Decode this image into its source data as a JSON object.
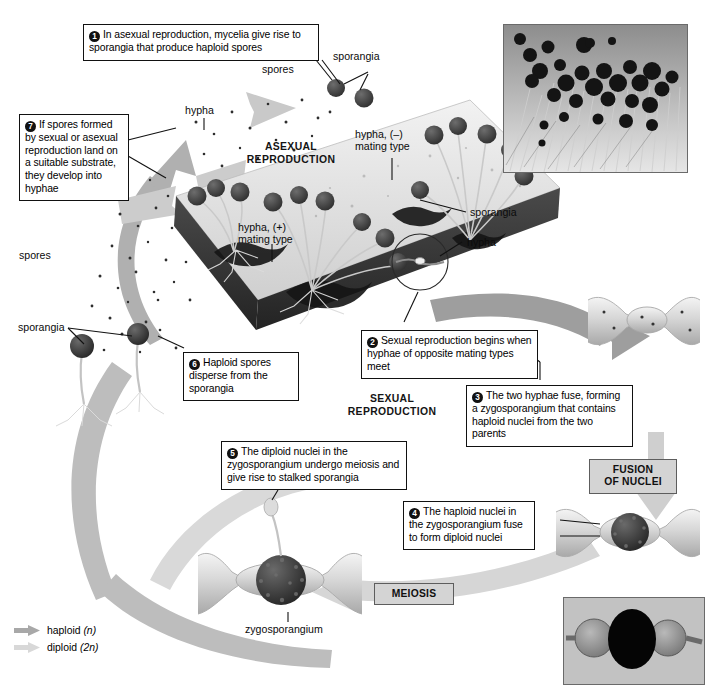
{
  "figure": {
    "colors": {
      "haploid_arrow": "#a8a8a8",
      "diploid_arrow": "#d8d8d8",
      "callout_border": "#111111",
      "stage_box_fill": "#d4d4d4",
      "stage_box_border": "#5d5d5d",
      "substrate_dark": "#3a3a3a",
      "sporangium": "#4a4a4a",
      "background": "#ffffff"
    }
  },
  "callouts": [
    {
      "id": 1,
      "number": "1",
      "text": "In asexual reproduction, mycelia give rise to sporangia that produce haploid spores"
    },
    {
      "id": 2,
      "number": "2",
      "text": "Sexual reproduction begins when hyphae of opposite mating types meet"
    },
    {
      "id": 3,
      "number": "3",
      "text": "The two hyphae fuse, forming a zygosporangium that contains haploid nuclei from the two parents"
    },
    {
      "id": 4,
      "number": "4",
      "text": "The haploid nuclei in the zygosporangium fuse to form diploid nuclei"
    },
    {
      "id": 5,
      "number": "5",
      "text": "The diploid nuclei in the zygosporangium undergo meiosis and give rise to stalked sporangia"
    },
    {
      "id": 6,
      "number": "6",
      "text": "Haploid spores disperse from the sporangia"
    },
    {
      "id": 7,
      "number": "7",
      "text": "If spores formed by sexual or asexual reproduction land on a suitable substrate, they develop into hyphae"
    }
  ],
  "stage_boxes": [
    {
      "id": "fusion",
      "text": "FUSION\nOF NUCLEI"
    },
    {
      "id": "meiosis",
      "text": "MEIOSIS"
    }
  ],
  "stage_words": [
    {
      "id": "asexual",
      "text": "ASEXUAL\nREPRODUCTION"
    },
    {
      "id": "sexual",
      "text": "SEXUAL\nREPRODUCTION"
    }
  ],
  "labels": [
    {
      "id": "spores-top",
      "text": "spores"
    },
    {
      "id": "sporangia-top",
      "text": "sporangia"
    },
    {
      "id": "hypha-top",
      "text": "hypha"
    },
    {
      "id": "hypha-minus",
      "text": "hypha, (–)\nmating type"
    },
    {
      "id": "hypha-plus",
      "text": "hypha, (+)\nmating type"
    },
    {
      "id": "sporangia-right",
      "text": "sporangia"
    },
    {
      "id": "hypha-right",
      "text": "hypha"
    },
    {
      "id": "spores-left",
      "text": "spores"
    },
    {
      "id": "sporangia-left",
      "text": "sporangia"
    },
    {
      "id": "zygosporangium",
      "text": "zygosporangium"
    }
  ],
  "legend": {
    "items": [
      {
        "id": "haploid",
        "label": "haploid",
        "ploidy": "(n)",
        "color": "#a8a8a8"
      },
      {
        "id": "diploid",
        "label": "diploid",
        "ploidy": "(2n)",
        "color": "#d8d8d8"
      }
    ]
  },
  "photos": [
    {
      "id": "photo-top",
      "caption": "micrograph of sporangia on hyphae"
    },
    {
      "id": "photo-bottom",
      "caption": "micrograph of a zygosporangium between two suspensors"
    }
  ]
}
